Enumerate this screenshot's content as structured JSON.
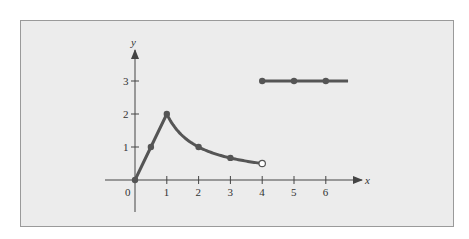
{
  "chart_data": {
    "type": "line",
    "title": "",
    "xlabel": "x",
    "ylabel": "y",
    "xlim": [
      -1,
      7
    ],
    "ylim": [
      -1,
      4
    ],
    "grid": false,
    "x_ticks": [
      "0",
      "1",
      "2",
      "3",
      "4",
      "5",
      "6"
    ],
    "y_ticks": [
      "1",
      "2",
      "3"
    ],
    "series": [
      {
        "name": "piece-1",
        "description": "linear from (0,0) to (1,2)",
        "points": [
          [
            0,
            0
          ],
          [
            0.5,
            1
          ],
          [
            1,
            2
          ]
        ],
        "closed_points": [
          [
            0,
            0
          ],
          [
            0.5,
            1
          ],
          [
            1,
            2
          ]
        ]
      },
      {
        "name": "piece-2",
        "description": "decreasing curve y = 2/x from x=1 to x=4 (open at x=4)",
        "points": [
          [
            1,
            2
          ],
          [
            2,
            1
          ],
          [
            3,
            0.67
          ],
          [
            4,
            0.5
          ]
        ],
        "closed_points": [
          [
            2,
            1
          ],
          [
            3,
            0.67
          ]
        ],
        "open_points": [
          [
            4,
            0.5
          ]
        ]
      },
      {
        "name": "piece-3",
        "description": "constant y = 3 for x >= 4",
        "points": [
          [
            4,
            3
          ],
          [
            5,
            3
          ],
          [
            6,
            3
          ],
          [
            6.7,
            3
          ]
        ],
        "closed_points": [
          [
            4,
            3
          ],
          [
            5,
            3
          ],
          [
            6,
            3
          ]
        ]
      }
    ],
    "colors": {
      "curve": "#555555",
      "axes": "#444444",
      "background": "#ececec",
      "border": "#9a9a9a"
    }
  }
}
